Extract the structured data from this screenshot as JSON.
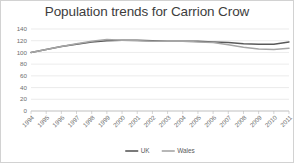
{
  "chart_data": {
    "type": "line",
    "title": "Population trends for Carrion Crow",
    "xlabel": "",
    "ylabel": "",
    "ylim": [
      0,
      140
    ],
    "yticks": [
      0,
      20,
      40,
      60,
      80,
      100,
      120,
      140
    ],
    "grid": true,
    "legend_position": "bottom-center",
    "categories": [
      "1994",
      "1995",
      "1996",
      "1997",
      "1998",
      "1999",
      "2000",
      "2001",
      "2002",
      "2003",
      "2004",
      "2005",
      "2006",
      "2007",
      "2008",
      "2009",
      "2010",
      "2011"
    ],
    "series": [
      {
        "name": "UK",
        "color": "#595959",
        "values": [
          100,
          105,
          110,
          114,
          118,
          120,
          121,
          121,
          120,
          119,
          119,
          119,
          118,
          117,
          115,
          114,
          114,
          118
        ]
      },
      {
        "name": "Wales",
        "color": "#a6a6a6",
        "values": [
          100,
          105,
          110,
          115,
          119,
          122,
          121,
          120,
          119,
          119,
          119,
          118,
          117,
          113,
          109,
          106,
          105,
          107
        ]
      }
    ]
  },
  "legend": {
    "items": [
      {
        "label": "UK"
      },
      {
        "label": "Wales"
      }
    ]
  }
}
